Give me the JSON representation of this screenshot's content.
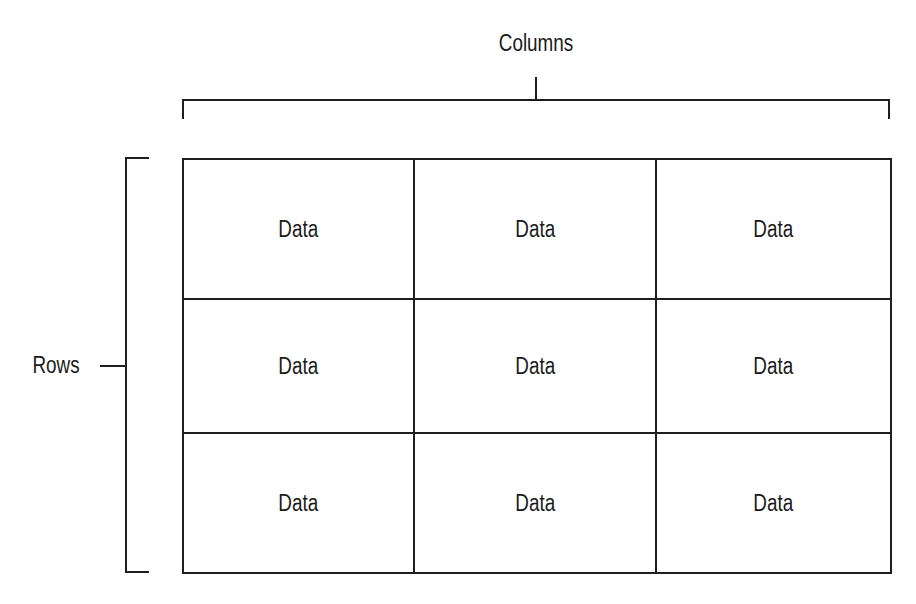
{
  "labels": {
    "columns": "Columns",
    "rows": "Rows"
  },
  "table": {
    "rows": [
      [
        "Data",
        "Data",
        "Data"
      ],
      [
        "Data",
        "Data",
        "Data"
      ],
      [
        "Data",
        "Data",
        "Data"
      ]
    ]
  },
  "colors": {
    "line": "#1e1e1e",
    "background": "#ffffff"
  }
}
